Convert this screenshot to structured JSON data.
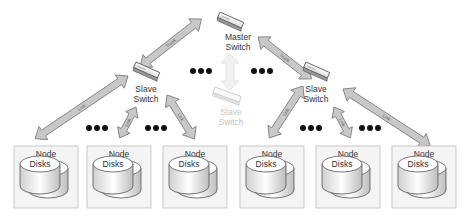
{
  "diagram": {
    "master_switch": {
      "label_line1": "Master",
      "label_line2": "Switch"
    },
    "slave_switch_left": {
      "label_line1": "Slave",
      "label_line2": "Switch"
    },
    "slave_switch_right": {
      "label_line1": "Slave",
      "label_line2": "Switch"
    },
    "slave_switch_faded": {
      "label_line1": "Slave",
      "label_line2": "Switch"
    },
    "trunk_label": "Trunk",
    "link_label": "Link",
    "nodes": [
      {
        "title": "Node",
        "disks": "Disks"
      },
      {
        "title": "Node",
        "disks": "Disks"
      },
      {
        "title": "Node",
        "disks": "Disks"
      },
      {
        "title": "Node",
        "disks": "Disks"
      },
      {
        "title": "Node",
        "disks": "Disks"
      },
      {
        "title": "Node",
        "disks": "Disks"
      }
    ],
    "colors": {
      "arrow_fill": "#c8c8c8",
      "arrow_stroke": "#7a7a7a",
      "node_border": "#bdbdbd",
      "node_bg": "#f4f4f4",
      "dots": "#111111",
      "faded": "#d0d0d0"
    }
  }
}
